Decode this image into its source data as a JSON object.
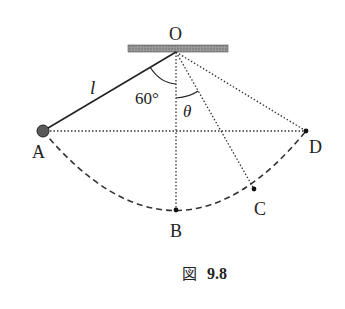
{
  "figure": {
    "caption_prefix": "図",
    "caption_number": "9.8"
  },
  "labels": {
    "pivot": "O",
    "point_a": "A",
    "point_b": "B",
    "point_c": "C",
    "point_d": "D",
    "length": "l",
    "angle_a": "60°",
    "angle_theta": "θ"
  },
  "colors": {
    "line": "#222222",
    "ceiling": "#8a8a8a",
    "bob": "#555555"
  }
}
